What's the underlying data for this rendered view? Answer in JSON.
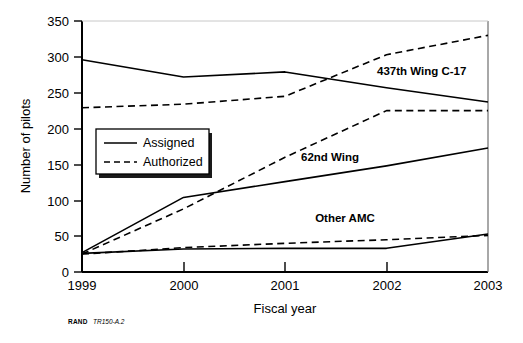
{
  "chart_data": {
    "type": "line",
    "title": "",
    "subtitle": "",
    "xlabel": "Fiscal year",
    "ylabel": "Number of pilots",
    "x": [
      1999,
      2000,
      2001,
      2002,
      2003
    ],
    "xtick_labels": [
      "1999",
      "2000",
      "2001",
      "2002",
      "2003"
    ],
    "ytick_labels": [
      "0",
      "50",
      "100",
      "150",
      "200",
      "250",
      "300",
      "350"
    ],
    "ytick_values": [
      0,
      50,
      100,
      150,
      200,
      250,
      300,
      350
    ],
    "xlim": [
      1999,
      2003
    ],
    "ylim": [
      0,
      350
    ],
    "grid": false,
    "legend_position": "inside-left",
    "legend": [
      {
        "label": "Assigned",
        "style": "solid"
      },
      {
        "label": "Authorized",
        "style": "dashed"
      }
    ],
    "groups": [
      {
        "name": "437th Wing C-17",
        "annotation": "437th Wing C-17",
        "series": [
          {
            "name": "Assigned",
            "style": "solid",
            "values": [
              296,
              272,
              279,
              257,
              237
            ]
          },
          {
            "name": "Authorized",
            "style": "dashed",
            "values": [
              229,
              234,
              245,
              303,
              330
            ]
          }
        ]
      },
      {
        "name": "62nd Wing",
        "annotation": "62nd Wing",
        "series": [
          {
            "name": "Assigned",
            "style": "solid",
            "values": [
              27,
              104,
              126,
              148,
              173
            ]
          },
          {
            "name": "Authorized",
            "style": "dashed",
            "values": [
              25,
              88,
              160,
              225,
              225
            ]
          }
        ]
      },
      {
        "name": "Other AMC",
        "annotation": "Other AMC",
        "series": [
          {
            "name": "Assigned",
            "style": "solid",
            "values": [
              26,
              32,
              33,
              33,
              53
            ]
          },
          {
            "name": "Authorized",
            "style": "dashed",
            "values": [
              25,
              34,
              40,
              45,
              51
            ]
          }
        ]
      }
    ],
    "annotations": [
      {
        "text": "437th Wing C-17",
        "x": 2002.1,
        "y": 272
      },
      {
        "text": "62nd Wing",
        "x": 2001.3,
        "y": 160
      },
      {
        "text": "Other AMC",
        "x": 2001.8,
        "y": 78
      }
    ],
    "colors": {
      "line": "#000000",
      "background": "#ffffff",
      "axis": "#000000"
    }
  },
  "credit": {
    "org": "RAND",
    "id": "TR150-A.2"
  }
}
